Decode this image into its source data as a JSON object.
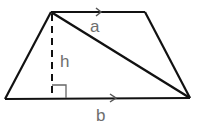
{
  "diagram": {
    "shape": "trapezoid",
    "vertices": {
      "top_left": [
        51,
        12
      ],
      "top_right": [
        145,
        12
      ],
      "bottom_right": [
        190,
        98
      ],
      "bottom_left": [
        5,
        99
      ]
    },
    "labels": {
      "top_diagonal": "a",
      "height": "h",
      "bottom_base": "b"
    },
    "elements": [
      {
        "type": "edge",
        "name": "top-base",
        "from": "top_left",
        "to": "top_right",
        "parallel_marker": true
      },
      {
        "type": "edge",
        "name": "bottom-base",
        "from": "bottom_left",
        "to": "bottom_right",
        "parallel_marker": true
      },
      {
        "type": "edge",
        "name": "left-leg",
        "from": "bottom_left",
        "to": "top_left"
      },
      {
        "type": "edge",
        "name": "right-leg",
        "from": "top_right",
        "to": "bottom_right"
      },
      {
        "type": "diagonal",
        "name": "diagonal-a",
        "from": "top_left",
        "to": "bottom_right",
        "label": "a"
      },
      {
        "type": "height",
        "name": "height-h",
        "style": "dashed",
        "from": "top_left",
        "to_foot": [
          52,
          99
        ],
        "label": "h",
        "right_angle_marker": true
      }
    ],
    "colors": {
      "line": "#111111",
      "label": "#6e6e6e",
      "background": "#ffffff"
    }
  }
}
